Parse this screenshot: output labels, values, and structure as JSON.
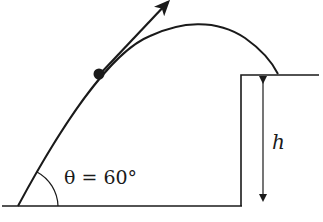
{
  "diagram": {
    "type": "projectile-motion",
    "angle_label": "θ = 60°",
    "height_label": "h",
    "colors": {
      "stroke": "#1a1a1a",
      "background": "#ffffff"
    },
    "elements": {
      "ground": "horizontal ground line",
      "cliff": "raised platform of height h",
      "trajectory": "parabolic path from ground to cliff top",
      "projectile": "solid dot on trajectory",
      "velocity_vector": "arrow tangent to trajectory at projectile"
    }
  }
}
